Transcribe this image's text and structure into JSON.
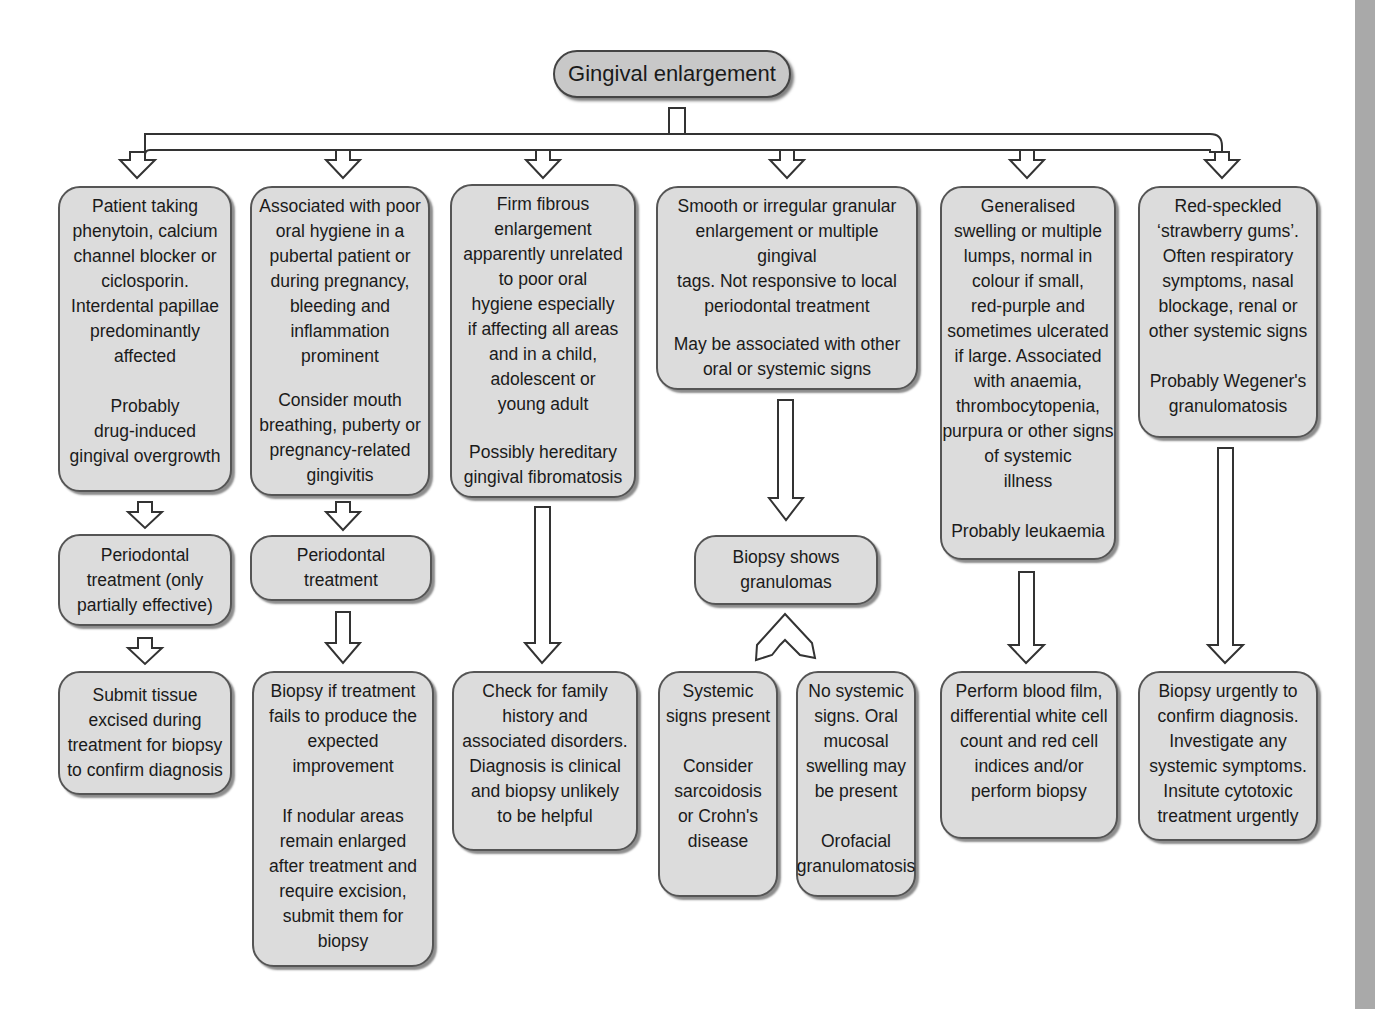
{
  "title": "Gingival enlargement",
  "colors": {
    "box_fill": "#dcdcdc",
    "root_fill": "#c8c8c8",
    "border": "#555555",
    "strip": "#a9a9a9"
  },
  "columns": [
    {
      "id": "drug",
      "top": {
        "description": "Patient taking\nphenytoin, calcium\nchannel blocker or\nciclosporin.\nInterdental papillae\npredominantly\naffected",
        "conclusion": "Probably\ndrug-induced\ngingival overgrowth"
      },
      "middle": "Periodontal\ntreatment (only\npartially effective)",
      "bottom": "Submit tissue\nexcised during\ntreatment for biopsy\nto confirm diagnosis"
    },
    {
      "id": "hygiene",
      "top": {
        "description": "Associated with poor\noral hygiene in a\npubertal patient or\nduring pregnancy,\nbleeding and\ninflammation\nprominent",
        "conclusion": "Consider mouth\nbreathing, puberty or\npregnancy-related\ngingivitis"
      },
      "middle": "Periodontal\ntreatment",
      "bottom": {
        "part1": "Biopsy if treatment\nfails to produce the\nexpected\nimprovement",
        "part2": "If nodular areas\nremain enlarged\nafter treatment and\nrequire excision,\nsubmit them for\nbiopsy"
      }
    },
    {
      "id": "fibrous",
      "top": {
        "description": "Firm fibrous\nenlargement\napparently unrelated\nto poor oral\nhygiene especially\nif affecting all areas\nand in a child,\nadolescent or\nyoung adult",
        "conclusion": "Possibly hereditary\ngingival fibromatosis"
      },
      "bottom": "Check for family\nhistory and\nassociated disorders.\nDiagnosis is clinical\nand biopsy unlikely\nto be helpful"
    },
    {
      "id": "granular",
      "top": {
        "description": "Smooth or irregular granular\nenlargement or multiple gingival\ntags. Not responsive to local\nperiodontal treatment",
        "conclusion": "May be associated with other\noral or systemic signs"
      },
      "middle": "Biopsy shows\ngranulomas",
      "bottom_left": {
        "part1": "Systemic\nsigns present",
        "part2": "Consider\nsarcoidosis\nor Crohn's\ndisease"
      },
      "bottom_right": {
        "part1": "No systemic\nsigns. Oral\nmucosal\nswelling may\nbe present",
        "part2": "Orofacial\ngranulomatosis"
      }
    },
    {
      "id": "leukaemia",
      "top": {
        "description": "Generalised\nswelling or multiple\nlumps, normal in\ncolour if small,\nred-purple and\nsometimes ulcerated\nif large. Associated\nwith anaemia,\nthrombocytopenia,\npurpura or other signs\nof systemic\nillness",
        "conclusion": "Probably leukaemia"
      },
      "bottom": "Perform blood film,\ndifferential white cell\ncount and red cell\nindices and/or\nperform biopsy"
    },
    {
      "id": "wegener",
      "top": {
        "description": "Red-speckled\n‘strawberry gums’.\nOften respiratory\nsymptoms, nasal\nblockage, renal or\nother systemic signs",
        "conclusion": "Probably Wegener's\ngranulomatosis"
      },
      "bottom": "Biopsy urgently to\nconfirm diagnosis.\nInvestigate any\nsystemic symptoms.\nInsitute cytotoxic\ntreatment urgently"
    }
  ]
}
